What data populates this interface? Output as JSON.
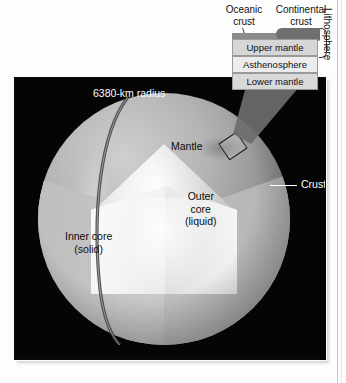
{
  "figure": {
    "panel_bg": "#050505",
    "labels": {
      "radius": "6380-km radius",
      "mantle": "Mantle",
      "outer_core_line1": "Outer",
      "outer_core_line2": "core",
      "outer_core_line3": "(liquid)",
      "inner_core_line1": "Inner core",
      "inner_core_line2": "(solid)",
      "crust": "Crust"
    }
  },
  "inset": {
    "top_labels": {
      "oceanic_line1": "Oceanic",
      "oceanic_line2": "crust",
      "continental_line1": "Continental",
      "continental_line2": "crust"
    },
    "layers": [
      {
        "name": "Upper mantle",
        "color": "#d6d6d6"
      },
      {
        "name": "Asthenosphere",
        "color": "#ececec"
      },
      {
        "name": "Lower mantle",
        "color": "#d9d9d9"
      }
    ],
    "bracket_label": "Lithosphere"
  }
}
